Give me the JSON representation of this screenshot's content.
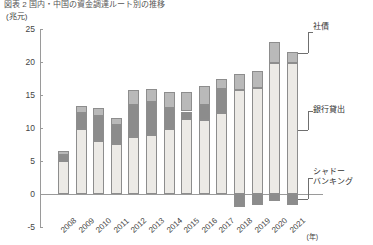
{
  "header": {
    "top_caption": "図表  2   国内・中国の資金調達ルート別の推移"
  },
  "axes": {
    "y_unit": "(兆元)",
    "y_ticks": [
      25,
      20,
      15,
      10,
      5,
      0,
      -5
    ],
    "y_tick_labels": [
      "25",
      "20",
      "15",
      "10",
      "5",
      "0",
      "-5"
    ],
    "x_unit": "(年)",
    "x_labels": [
      "2008",
      "2009",
      "2010",
      "2011",
      "2012",
      "2013",
      "2014",
      "2015",
      "2016",
      "2017",
      "2018",
      "2019",
      "2020",
      "2021"
    ]
  },
  "legend": {
    "bonds": "社債",
    "loans": "銀行貸出",
    "shadow": "シャドー\nバンキング"
  },
  "colors": {
    "loans": "#eceae6",
    "shadow": "#8c8c8c",
    "bonds": "#b9b9b9",
    "axis": "#9a9a9a",
    "text": "#333333"
  },
  "chart_data": {
    "type": "bar",
    "stacked": true,
    "title": "国内・中国の資金調達ルート別の推移",
    "xlabel": "(年)",
    "ylabel": "(兆元)",
    "ylim": [
      -5,
      25
    ],
    "grid": false,
    "legend_position": "right",
    "categories": [
      "2008",
      "2009",
      "2010",
      "2011",
      "2012",
      "2013",
      "2014",
      "2015",
      "2016",
      "2017",
      "2018",
      "2019",
      "2020",
      "2021"
    ],
    "series": [
      {
        "name": "銀行貸出",
        "values": [
          5.0,
          9.8,
          8.0,
          7.6,
          8.7,
          9.0,
          9.8,
          11.3,
          11.2,
          12.3,
          15.8,
          16.0,
          19.8,
          19.9
        ]
      },
      {
        "name": "シャドーバンキング",
        "values": [
          0.9,
          2.5,
          3.8,
          2.8,
          4.8,
          4.9,
          3.3,
          1.2,
          2.3,
          3.6,
          -1.9,
          -1.6,
          -1.0,
          -1.7
        ]
      },
      {
        "name": "社債",
        "values": [
          0.6,
          1.1,
          1.2,
          1.1,
          2.3,
          2.0,
          2.4,
          2.9,
          2.9,
          1.5,
          2.4,
          2.7,
          3.3,
          1.6
        ]
      }
    ]
  }
}
